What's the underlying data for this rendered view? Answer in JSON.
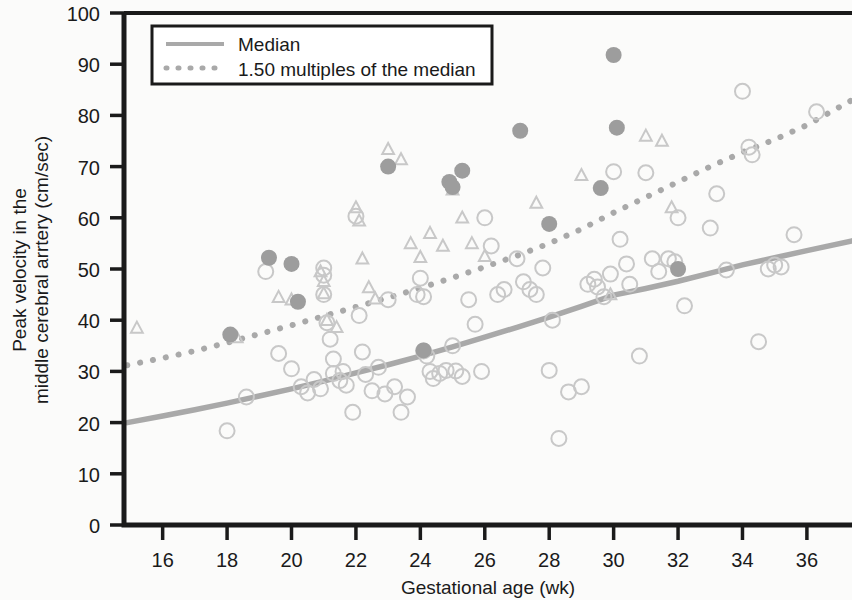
{
  "chart_data": {
    "type": "scatter",
    "title": "",
    "xlabel": "Gestational age (wk)",
    "ylabel": "Peak velocity in the\nmiddle cerebral arrtery (cm/sec)",
    "ylabel_line1": "Peak velocity in the",
    "ylabel_line2": "middle cerebral arrtery (cm/sec)",
    "xlim": [
      14.8,
      37.4
    ],
    "ylim": [
      0,
      100
    ],
    "xticks": [
      16,
      18,
      20,
      22,
      24,
      26,
      28,
      30,
      32,
      34,
      36
    ],
    "yticks": [
      0,
      10,
      20,
      30,
      40,
      50,
      60,
      70,
      80,
      90,
      100
    ],
    "grid": false,
    "legend_position": "top-left-inside",
    "colors": {
      "axis": "#1a1a1a",
      "median_line": "#a9a9a9",
      "mom_line": "#a9a9a9",
      "open_marker": "#c8c8c8",
      "filled_marker": "#9d9d9d",
      "background": "#fbfbfa"
    },
    "legend": [
      {
        "label": "Median",
        "style": "solid",
        "color": "#a9a9a9"
      },
      {
        "label": "1.50 multiples of the median",
        "style": "dotted",
        "color": "#a9a9a9"
      }
    ],
    "series": [
      {
        "name": "Median",
        "type": "line",
        "style": "solid",
        "color": "#a9a9a9",
        "points": [
          [
            14.9,
            20.0
          ],
          [
            16,
            21.3
          ],
          [
            17,
            22.5
          ],
          [
            18,
            23.8
          ],
          [
            19,
            25.2
          ],
          [
            20,
            26.6
          ],
          [
            21,
            28.1
          ],
          [
            22,
            29.7
          ],
          [
            23,
            31.3
          ],
          [
            24,
            33.0
          ],
          [
            25,
            34.8
          ],
          [
            26,
            36.7
          ],
          [
            27,
            38.6
          ],
          [
            28,
            40.6
          ],
          [
            29,
            42.7
          ],
          [
            30,
            44.9
          ],
          [
            31,
            46.2
          ],
          [
            32,
            47.6
          ],
          [
            33,
            49.2
          ],
          [
            34,
            50.8
          ],
          [
            35,
            52.2
          ],
          [
            36,
            53.6
          ],
          [
            37.4,
            55.5
          ]
        ]
      },
      {
        "name": "1.50 multiples of the median",
        "type": "line",
        "style": "dotted",
        "color": "#a9a9a9",
        "points": [
          [
            14.9,
            31.2
          ],
          [
            16,
            32.6
          ],
          [
            17,
            34.0
          ],
          [
            18,
            35.6
          ],
          [
            19,
            37.3
          ],
          [
            20,
            39.0
          ],
          [
            21,
            40.8
          ],
          [
            22,
            42.6
          ],
          [
            23,
            44.4
          ],
          [
            24,
            46.3
          ],
          [
            25,
            48.3
          ],
          [
            26,
            50.4
          ],
          [
            27,
            52.6
          ],
          [
            28,
            55.0
          ],
          [
            29,
            57.8
          ],
          [
            30,
            61.0
          ],
          [
            31,
            64.0
          ],
          [
            32,
            67.0
          ],
          [
            33,
            70.0
          ],
          [
            34,
            72.8
          ],
          [
            35,
            75.3
          ],
          [
            36,
            78.1
          ],
          [
            37.4,
            83.0
          ]
        ]
      },
      {
        "name": "Open circles",
        "type": "scatter",
        "marker": "open-circle",
        "color": "#c8c8c8",
        "points": [
          [
            18.0,
            18.4
          ],
          [
            18.6,
            25.0
          ],
          [
            19.2,
            49.5
          ],
          [
            19.6,
            33.5
          ],
          [
            20.0,
            30.5
          ],
          [
            20.3,
            27.0
          ],
          [
            20.5,
            25.8
          ],
          [
            20.7,
            28.4
          ],
          [
            20.9,
            26.6
          ],
          [
            21.0,
            50.2
          ],
          [
            21.0,
            48.8
          ],
          [
            21.0,
            45.0
          ],
          [
            21.1,
            39.5
          ],
          [
            21.2,
            36.3
          ],
          [
            21.3,
            32.4
          ],
          [
            21.3,
            29.6
          ],
          [
            21.5,
            28.2
          ],
          [
            21.6,
            30.0
          ],
          [
            21.7,
            27.3
          ],
          [
            21.9,
            22.0
          ],
          [
            22.0,
            60.3
          ],
          [
            22.1,
            40.9
          ],
          [
            22.2,
            33.8
          ],
          [
            22.3,
            29.4
          ],
          [
            22.5,
            26.2
          ],
          [
            22.7,
            30.8
          ],
          [
            22.9,
            25.6
          ],
          [
            23.0,
            44.0
          ],
          [
            23.2,
            27.0
          ],
          [
            23.4,
            22.0
          ],
          [
            23.6,
            25.0
          ],
          [
            23.9,
            45.0
          ],
          [
            24.0,
            48.2
          ],
          [
            24.1,
            44.6
          ],
          [
            24.1,
            34.0
          ],
          [
            24.2,
            33.0
          ],
          [
            24.3,
            30.0
          ],
          [
            24.4,
            28.6
          ],
          [
            24.6,
            29.6
          ],
          [
            24.8,
            30.2
          ],
          [
            25.0,
            35.0
          ],
          [
            25.1,
            30.1
          ],
          [
            25.3,
            29.0
          ],
          [
            25.5,
            44.0
          ],
          [
            25.7,
            39.2
          ],
          [
            25.9,
            30.0
          ],
          [
            26.0,
            60.0
          ],
          [
            26.2,
            54.5
          ],
          [
            26.4,
            45.0
          ],
          [
            26.6,
            46.0
          ],
          [
            27.0,
            52.0
          ],
          [
            27.2,
            47.5
          ],
          [
            27.4,
            46.0
          ],
          [
            27.6,
            45.0
          ],
          [
            27.8,
            50.2
          ],
          [
            28.0,
            30.2
          ],
          [
            28.1,
            40.0
          ],
          [
            28.3,
            16.9
          ],
          [
            28.6,
            26.0
          ],
          [
            29.0,
            27.0
          ],
          [
            29.2,
            47.0
          ],
          [
            29.4,
            48.0
          ],
          [
            29.5,
            46.5
          ],
          [
            29.7,
            44.6
          ],
          [
            29.9,
            49.0
          ],
          [
            30.0,
            69.0
          ],
          [
            30.2,
            55.8
          ],
          [
            30.4,
            51.0
          ],
          [
            30.5,
            47.0
          ],
          [
            30.8,
            33.0
          ],
          [
            31.0,
            68.8
          ],
          [
            31.2,
            52.0
          ],
          [
            31.4,
            49.5
          ],
          [
            31.7,
            52.0
          ],
          [
            31.9,
            51.4
          ],
          [
            32.0,
            60.0
          ],
          [
            32.2,
            42.8
          ],
          [
            33.0,
            58.0
          ],
          [
            33.2,
            64.7
          ],
          [
            33.5,
            49.8
          ],
          [
            34.0,
            84.7
          ],
          [
            34.2,
            73.8
          ],
          [
            34.3,
            72.3
          ],
          [
            34.5,
            35.8
          ],
          [
            34.8,
            50.0
          ],
          [
            35.0,
            50.8
          ],
          [
            35.2,
            50.4
          ],
          [
            35.6,
            56.7
          ],
          [
            36.3,
            80.7
          ]
        ]
      },
      {
        "name": "Open triangles",
        "type": "scatter",
        "marker": "open-triangle",
        "color": "#c8c8c8",
        "points": [
          [
            15.2,
            38.5
          ],
          [
            18.3,
            36.6
          ],
          [
            19.6,
            44.5
          ],
          [
            20.0,
            44.0
          ],
          [
            20.9,
            49.5
          ],
          [
            21.0,
            47.6
          ],
          [
            21.0,
            45.2
          ],
          [
            21.1,
            40.0
          ],
          [
            21.4,
            38.6
          ],
          [
            22.0,
            62.0
          ],
          [
            22.1,
            59.4
          ],
          [
            22.2,
            52.0
          ],
          [
            22.4,
            46.4
          ],
          [
            22.6,
            44.2
          ],
          [
            23.0,
            73.4
          ],
          [
            23.4,
            71.4
          ],
          [
            23.7,
            55.0
          ],
          [
            24.0,
            52.3
          ],
          [
            24.3,
            57.0
          ],
          [
            24.7,
            54.5
          ],
          [
            25.0,
            65.5
          ],
          [
            25.3,
            60.0
          ],
          [
            25.6,
            55.0
          ],
          [
            26.0,
            52.5
          ],
          [
            27.6,
            62.9
          ],
          [
            29.0,
            68.3
          ],
          [
            29.9,
            45.0
          ],
          [
            31.0,
            76.0
          ],
          [
            31.5,
            75.0
          ],
          [
            31.8,
            62.0
          ]
        ]
      },
      {
        "name": "Filled circles",
        "type": "scatter",
        "marker": "filled-circle",
        "color": "#9d9d9d",
        "points": [
          [
            18.1,
            37.2
          ],
          [
            19.3,
            52.2
          ],
          [
            20.0,
            51.0
          ],
          [
            20.2,
            43.6
          ],
          [
            23.0,
            70.0
          ],
          [
            24.1,
            34.1
          ],
          [
            24.9,
            67.0
          ],
          [
            25.0,
            66.0
          ],
          [
            25.3,
            69.2
          ],
          [
            27.1,
            77.0
          ],
          [
            28.0,
            58.8
          ],
          [
            29.6,
            65.8
          ],
          [
            30.0,
            91.8
          ],
          [
            30.1,
            77.6
          ],
          [
            32.0,
            50.0
          ]
        ]
      }
    ]
  }
}
